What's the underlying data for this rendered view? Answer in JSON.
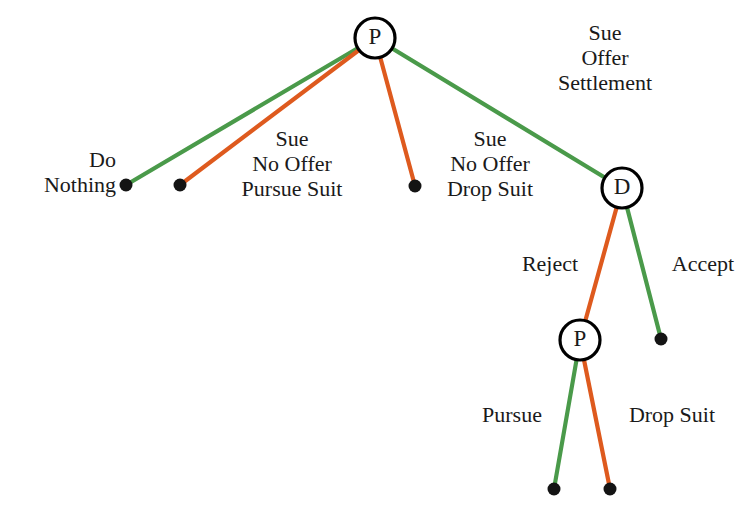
{
  "diagram": {
    "type": "extensive-form-game-tree",
    "canvas": {
      "width": 751,
      "height": 518,
      "background": "#ffffff"
    },
    "colors": {
      "green_edge": "#4a9a4a",
      "orange_edge": "#de5a1e",
      "node_stroke": "#000000",
      "node_fill": "#ffffff",
      "terminal_dot": "#141414",
      "text": "#1a1a1a"
    },
    "nodes": [
      {
        "id": "root",
        "label": "P",
        "kind": "decision",
        "player": "P",
        "x": 375,
        "y": 38,
        "r": 20
      },
      {
        "id": "d1",
        "label": "D",
        "kind": "decision",
        "player": "D",
        "x": 622,
        "y": 188,
        "r": 20
      },
      {
        "id": "p2",
        "label": "P",
        "kind": "decision",
        "player": "P",
        "x": 580,
        "y": 340,
        "r": 20
      },
      {
        "id": "t1",
        "label": "",
        "kind": "terminal",
        "x": 126,
        "y": 185,
        "r": 6.5
      },
      {
        "id": "t2",
        "label": "",
        "kind": "terminal",
        "x": 180,
        "y": 185,
        "r": 6.5
      },
      {
        "id": "t3",
        "label": "",
        "kind": "terminal",
        "x": 415,
        "y": 186,
        "r": 6.5
      },
      {
        "id": "t4",
        "label": "",
        "kind": "terminal",
        "x": 661,
        "y": 339,
        "r": 6.5
      },
      {
        "id": "t5",
        "label": "",
        "kind": "terminal",
        "x": 554,
        "y": 489,
        "r": 6.5
      },
      {
        "id": "t6",
        "label": "",
        "kind": "terminal",
        "x": 610,
        "y": 489,
        "r": 6.5
      }
    ],
    "edges": [
      {
        "id": "e-root-t1",
        "from": "root",
        "to": "t1",
        "color": "green",
        "width": 4.2,
        "action": "Do Nothing"
      },
      {
        "id": "e-root-t2",
        "from": "root",
        "to": "t2",
        "color": "orange",
        "width": 4.2,
        "action": "Sue No Offer Pursue Suit"
      },
      {
        "id": "e-root-t3",
        "from": "root",
        "to": "t3",
        "color": "orange",
        "width": 4.2,
        "action": "Sue No Offer Drop Suit"
      },
      {
        "id": "e-root-d1",
        "from": "root",
        "to": "d1",
        "color": "green",
        "width": 4.2,
        "action": "Sue Offer Settlement"
      },
      {
        "id": "e-d1-p2",
        "from": "d1",
        "to": "p2",
        "color": "orange",
        "width": 4.2,
        "action": "Reject"
      },
      {
        "id": "e-d1-t4",
        "from": "d1",
        "to": "t4",
        "color": "green",
        "width": 4.2,
        "action": "Accept"
      },
      {
        "id": "e-p2-t5",
        "from": "p2",
        "to": "t5",
        "color": "green",
        "width": 4.2,
        "action": "Pursue"
      },
      {
        "id": "e-p2-t6",
        "from": "p2",
        "to": "t6",
        "color": "orange",
        "width": 4.2,
        "action": "Drop Suit"
      }
    ],
    "labels": [
      {
        "id": "label-do-nothing",
        "name": "edge-label-do-nothing",
        "lines": [
          "Do",
          "Nothing"
        ],
        "text": "Do\nNothing",
        "x": 116,
        "y": 147,
        "align": "right"
      },
      {
        "id": "label-sue-no-offer-pursue-suit",
        "name": "edge-label-sue-no-offer-pursue-suit",
        "lines": [
          "Sue",
          "No Offer",
          "Pursue Suit"
        ],
        "text": "Sue\nNo Offer\nPursue Suit",
        "x": 292,
        "y": 126,
        "align": "center"
      },
      {
        "id": "label-sue-no-offer-drop-suit",
        "name": "edge-label-sue-no-offer-drop-suit",
        "lines": [
          "Sue",
          "No Offer",
          "Drop Suit"
        ],
        "text": "Sue\nNo Offer\nDrop Suit",
        "x": 490,
        "y": 126,
        "align": "center"
      },
      {
        "id": "label-sue-offer-settlement",
        "name": "edge-label-sue-offer-settlement",
        "lines": [
          "Sue",
          "Offer",
          "Settlement"
        ],
        "text": "Sue\nOffer\nSettlement",
        "x": 605,
        "y": 20,
        "align": "center"
      },
      {
        "id": "label-reject",
        "name": "edge-label-reject",
        "lines": [
          "Reject"
        ],
        "text": "Reject",
        "x": 550,
        "y": 251,
        "align": "center"
      },
      {
        "id": "label-accept",
        "name": "edge-label-accept",
        "lines": [
          "Accept"
        ],
        "text": "Accept",
        "x": 703,
        "y": 251,
        "align": "center"
      },
      {
        "id": "label-pursue",
        "name": "edge-label-pursue",
        "lines": [
          "Pursue"
        ],
        "text": "Pursue",
        "x": 512,
        "y": 402,
        "align": "center"
      },
      {
        "id": "label-drop-suit",
        "name": "edge-label-drop-suit",
        "lines": [
          "Drop Suit"
        ],
        "text": "Drop Suit",
        "x": 672,
        "y": 402,
        "align": "center"
      }
    ]
  }
}
